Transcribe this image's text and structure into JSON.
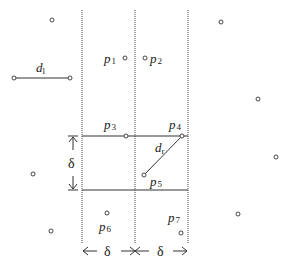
{
  "diagram": {
    "labels": {
      "d_left": "d",
      "d_left_sub": "l",
      "d_right": "d",
      "d_right_sub": "r",
      "delta_vertical": "δ",
      "delta_bottom_left": "δ",
      "delta_bottom_right": "δ"
    },
    "strip_points": [
      {
        "name": "p",
        "sub": "1",
        "cx": 125,
        "cy": 58
      },
      {
        "name": "p",
        "sub": "2",
        "cx": 145,
        "cy": 58
      },
      {
        "name": "p",
        "sub": "3",
        "cx": 126,
        "cy": 136
      },
      {
        "name": "p",
        "sub": "4",
        "cx": 182,
        "cy": 136
      },
      {
        "name": "p",
        "sub": "5",
        "cx": 144,
        "cy": 175
      },
      {
        "name": "p",
        "sub": "6",
        "cx": 107,
        "cy": 213
      },
      {
        "name": "p",
        "sub": "7",
        "cx": 181,
        "cy": 233
      }
    ],
    "outer_points": [
      {
        "cx": 52,
        "cy": 20
      },
      {
        "cx": 33,
        "cy": 174
      },
      {
        "cx": 51,
        "cy": 231
      },
      {
        "cx": 221,
        "cy": 22
      },
      {
        "cx": 258,
        "cy": 99
      },
      {
        "cx": 276,
        "cy": 157
      },
      {
        "cx": 238,
        "cy": 214
      }
    ],
    "segments": {
      "d_left": {
        "x1": 14,
        "y1": 78,
        "x2": 70,
        "y2": 78
      },
      "d_right": {
        "x1": 144,
        "y1": 175,
        "x2": 182,
        "y2": 136
      }
    },
    "vertical_lines_x": [
      82,
      135,
      188
    ],
    "box": {
      "x1": 82,
      "x2": 188,
      "y_top": 136,
      "y_bottom": 190
    }
  }
}
